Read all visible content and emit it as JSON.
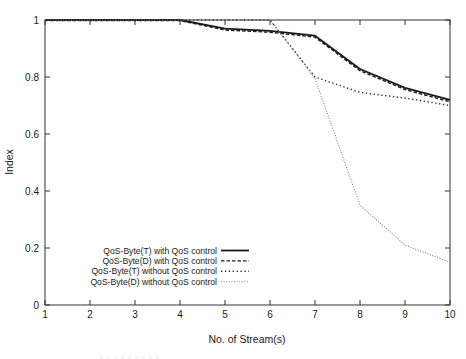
{
  "chart_data": {
    "type": "line",
    "title": "",
    "xlabel": "No. of Stream(s)",
    "ylabel": "Index",
    "xlim": [
      1,
      10
    ],
    "ylim": [
      0,
      1
    ],
    "x_ticks": [
      1,
      2,
      3,
      4,
      5,
      6,
      7,
      8,
      9,
      10
    ],
    "x_tick_labels": [
      "1",
      "2",
      "3",
      "4",
      "5",
      "6",
      "7",
      "8",
      "9",
      "10"
    ],
    "y_ticks": [
      0,
      0.2,
      0.4,
      0.6,
      0.8,
      1
    ],
    "y_tick_labels": [
      "0",
      "0.2",
      "0.4",
      "0.6",
      "0.8",
      "1"
    ],
    "grid": "off",
    "legend_position": "inside-lower-left",
    "axis_color": "#333333",
    "background_color": "#ffffff",
    "series": [
      {
        "name": "QoS-Byte(T) with QoS control",
        "line_style": "solid",
        "color": "#1a1a1a",
        "width": 1.8,
        "dash": "",
        "x": [
          1,
          2,
          3,
          4,
          5,
          6,
          7,
          8,
          9,
          10
        ],
        "y": [
          1.0,
          1.0,
          1.0,
          1.0,
          0.97,
          0.962,
          0.945,
          0.828,
          0.762,
          0.72
        ]
      },
      {
        "name": "QoS-Byte(D) with QoS control",
        "line_style": "dashed",
        "color": "#1a1a1a",
        "width": 1.4,
        "dash": "3.5,2",
        "x": [
          1,
          2,
          3,
          4,
          5,
          6,
          7,
          8,
          9,
          10
        ],
        "y": [
          0.998,
          0.998,
          0.998,
          0.998,
          0.965,
          0.957,
          0.94,
          0.822,
          0.756,
          0.713
        ]
      },
      {
        "name": "QoS-Byte(T) without QoS control",
        "line_style": "dotted",
        "color": "#2a2a2a",
        "width": 1.4,
        "dash": "1.3,2.6",
        "x": [
          1,
          2,
          3,
          4,
          5,
          6,
          7,
          8,
          9,
          10
        ],
        "y": [
          1.0,
          1.0,
          1.0,
          1.0,
          1.0,
          1.0,
          0.8,
          0.746,
          0.726,
          0.7
        ]
      },
      {
        "name": "QoS-Byte(D) without QoS control",
        "line_style": "fine-dotted",
        "color": "#808080",
        "width": 1.1,
        "dash": "1,1.6",
        "x": [
          1,
          2,
          3,
          4,
          5,
          6,
          7,
          8,
          9,
          10
        ],
        "y": [
          1.0,
          1.0,
          1.0,
          1.0,
          1.0,
          1.0,
          0.795,
          0.35,
          0.21,
          0.15
        ]
      }
    ]
  }
}
